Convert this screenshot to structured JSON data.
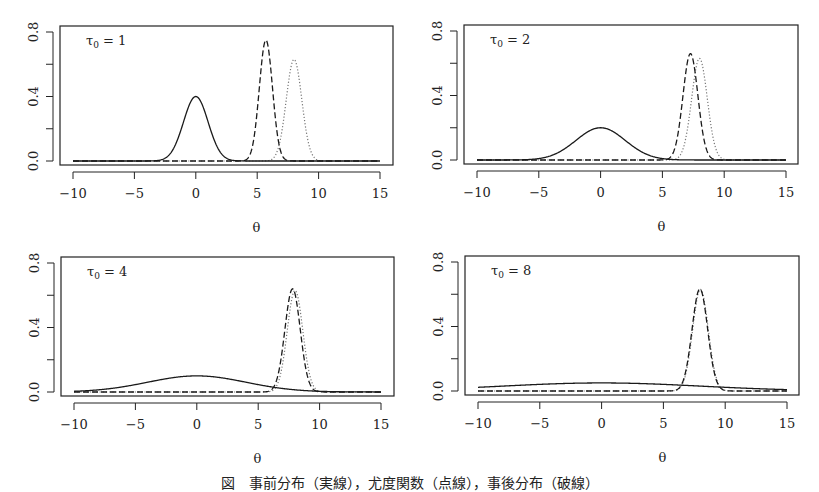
{
  "figure": {
    "caption": "図　事前分布（実線），尤度関数（点線），事後分布（破線）"
  },
  "chart_data": [
    {
      "type": "line",
      "title": "τ0 = 1",
      "label_tau": "1",
      "xlabel": "θ",
      "ylabel": "",
      "xlim": [
        -10,
        15
      ],
      "ylim": [
        0,
        0.8
      ],
      "xticks": [
        -10,
        -5,
        0,
        5,
        10,
        15
      ],
      "yticks": [
        "0.0",
        "0.4",
        "0.8"
      ],
      "yticks_minor": [
        0.2,
        0.6
      ],
      "grid": false,
      "series": [
        {
          "name": "prior",
          "style": "solid",
          "mean": 0,
          "sd": 1.0,
          "peak": 0.4
        },
        {
          "name": "posterior",
          "style": "dashed",
          "mean": 5.71,
          "sd": 0.535,
          "peak": 0.75
        },
        {
          "name": "likelihood",
          "style": "dotted",
          "mean": 8.0,
          "sd": 0.632,
          "peak": 0.63
        }
      ]
    },
    {
      "type": "line",
      "title": "τ0 = 2",
      "label_tau": "2",
      "xlabel": "θ",
      "ylabel": "",
      "xlim": [
        -10,
        15
      ],
      "ylim": [
        0,
        0.8
      ],
      "xticks": [
        -10,
        -5,
        0,
        5,
        10,
        15
      ],
      "yticks": [
        "0.0",
        "0.4",
        "0.8"
      ],
      "yticks_minor": [
        0.2,
        0.6
      ],
      "grid": false,
      "series": [
        {
          "name": "prior",
          "style": "solid",
          "mean": 0,
          "sd": 2.0,
          "peak": 0.2
        },
        {
          "name": "posterior",
          "style": "dashed",
          "mean": 7.27,
          "sd": 0.603,
          "peak": 0.66
        },
        {
          "name": "likelihood",
          "style": "dotted",
          "mean": 8.0,
          "sd": 0.632,
          "peak": 0.63
        }
      ]
    },
    {
      "type": "line",
      "title": "τ0 = 4",
      "label_tau": "4",
      "xlabel": "θ",
      "ylabel": "",
      "xlim": [
        -10,
        15
      ],
      "ylim": [
        0,
        0.8
      ],
      "xticks": [
        -10,
        -5,
        0,
        5,
        10,
        15
      ],
      "yticks": [
        "0.0",
        "0.4",
        "0.8"
      ],
      "yticks_minor": [
        0.2,
        0.6
      ],
      "grid": false,
      "series": [
        {
          "name": "prior",
          "style": "solid",
          "mean": 0,
          "sd": 4.0,
          "peak": 0.1
        },
        {
          "name": "posterior",
          "style": "dashed",
          "mean": 7.8,
          "sd": 0.625,
          "peak": 0.64
        },
        {
          "name": "likelihood",
          "style": "dotted",
          "mean": 8.0,
          "sd": 0.632,
          "peak": 0.63
        }
      ]
    },
    {
      "type": "line",
      "title": "τ0 = 8",
      "label_tau": "8",
      "xlabel": "θ",
      "ylabel": "",
      "xlim": [
        -10,
        15
      ],
      "ylim": [
        0,
        0.8
      ],
      "xticks": [
        -10,
        -5,
        0,
        5,
        10,
        15
      ],
      "yticks": [
        "0.0",
        "0.4",
        "0.8"
      ],
      "yticks_minor": [
        0.2,
        0.6
      ],
      "grid": false,
      "series": [
        {
          "name": "prior",
          "style": "solid",
          "mean": 0,
          "sd": 8.0,
          "peak": 0.05
        },
        {
          "name": "posterior",
          "style": "dashed",
          "mean": 7.95,
          "sd": 0.63,
          "peak": 0.633
        },
        {
          "name": "likelihood",
          "style": "dotted",
          "mean": 8.0,
          "sd": 0.632,
          "peak": 0.63
        }
      ]
    }
  ],
  "layout": {
    "panels": [
      {
        "box": [
          60,
          26,
          393,
          165
        ],
        "x0px": 73,
        "x1px": 380,
        "y0px": 161,
        "y8px": 32
      },
      {
        "box": [
          464,
          25,
          798,
          164
        ],
        "x0px": 477,
        "x1px": 786,
        "y0px": 160,
        "y8px": 31
      },
      {
        "box": [
          61,
          257,
          394,
          396
        ],
        "x0px": 74,
        "x1px": 381,
        "y0px": 392,
        "y8px": 263
      },
      {
        "box": [
          465,
          256,
          799,
          395
        ],
        "x0px": 478,
        "x1px": 787,
        "y0px": 391,
        "y8px": 262
      }
    ],
    "colors": {
      "axis": "#222222",
      "solid": "#1a1a1a",
      "dashed": "#1a1a1a",
      "dotted": "#777777"
    }
  }
}
